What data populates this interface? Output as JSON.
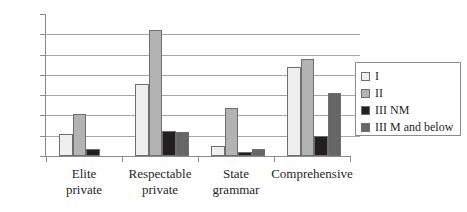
{
  "chart_data": {
    "type": "bar",
    "title": "",
    "subtitle": "",
    "xlabel": "",
    "ylabel": "",
    "ylim": [
      0,
      70
    ],
    "ytick_step": 10,
    "yticks": [
      0,
      10,
      20,
      30,
      40,
      50,
      60,
      70
    ],
    "ytick_labels": [
      "0",
      "10",
      "20",
      "30",
      "40",
      "50",
      "60",
      "70"
    ],
    "grid": true,
    "grid_axis": "y",
    "legend_position": "right",
    "categories": [
      "Elite private",
      "Respectable private",
      "State grammar",
      "Comprehensive"
    ],
    "category_lines": [
      [
        "Elite",
        "private"
      ],
      [
        "Respectable",
        "private"
      ],
      [
        "State",
        "grammar"
      ],
      [
        "Comprehensive",
        ""
      ]
    ],
    "series": [
      {
        "name": "I",
        "color": "#efefef",
        "values": [
          11,
          35.5,
          5,
          44
        ]
      },
      {
        "name": "II",
        "color": "#b3b3b3",
        "values": [
          20.5,
          62,
          23.5,
          48
        ]
      },
      {
        "name": "III NM",
        "color": "#231f20",
        "values": [
          3.5,
          12.5,
          2,
          10
        ]
      },
      {
        "name": "III M and below",
        "color": "#666666",
        "values": [
          0,
          12,
          3.5,
          31
        ]
      }
    ]
  },
  "legend": {
    "items": [
      {
        "label": "I",
        "color": "#efefef"
      },
      {
        "label": "II",
        "color": "#b3b3b3"
      },
      {
        "label": "III NM",
        "color": "#231f20"
      },
      {
        "label": "III M and below",
        "color": "#666666"
      }
    ]
  },
  "colors": {
    "axis": "#8c8c8c",
    "grid": "#a6a6a6",
    "bar_border": "#6e6e6e",
    "background": "#ffffff",
    "text": "#1f1f1f"
  }
}
